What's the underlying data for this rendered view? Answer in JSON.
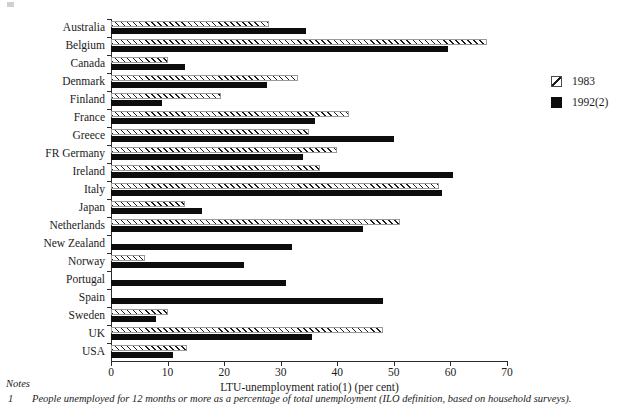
{
  "chart_data": {
    "type": "bar",
    "orientation": "horizontal",
    "title": "",
    "xlabel": "LTU-unemployment ratio(1) (per cent)",
    "ylabel": "",
    "xlim": [
      0,
      70
    ],
    "xticks": [
      0,
      10,
      20,
      30,
      40,
      50,
      60,
      70
    ],
    "grid": false,
    "legend_position": "right",
    "categories": [
      "Australia",
      "Belgium",
      "Canada",
      "Denmark",
      "Finland",
      "France",
      "Greece",
      "FR Germany",
      "Ireland",
      "Italy",
      "Japan",
      "Netherlands",
      "New Zealand",
      "Norway",
      "Portugal",
      "Spain",
      "Sweden",
      "UK",
      "USA"
    ],
    "series": [
      {
        "name": "1983",
        "pattern": "diagonal-hatch",
        "values": [
          28.0,
          66.5,
          10.0,
          33.0,
          19.5,
          42.0,
          35.0,
          40.0,
          37.0,
          58.0,
          13.0,
          51.0,
          null,
          6.0,
          null,
          null,
          10.0,
          48.0,
          13.5
        ]
      },
      {
        "name": "1992(2)",
        "pattern": "solid",
        "color": "#0d0d0d",
        "values": [
          34.5,
          59.5,
          13.0,
          27.5,
          9.0,
          36.0,
          50.0,
          34.0,
          60.5,
          58.5,
          16.0,
          44.5,
          32.0,
          23.5,
          31.0,
          48.0,
          8.0,
          35.5,
          11.0
        ]
      }
    ]
  },
  "legend": {
    "items": [
      {
        "label": "1983",
        "swatch": "hatch"
      },
      {
        "label": "1992(2)",
        "swatch": "solid"
      }
    ]
  },
  "notes": {
    "heading": "Notes",
    "items": [
      {
        "marker": "1",
        "text": "People unemployed for 12 months or more as a percentage of total unemployment (ILO definition, based on household surveys)."
      }
    ]
  }
}
